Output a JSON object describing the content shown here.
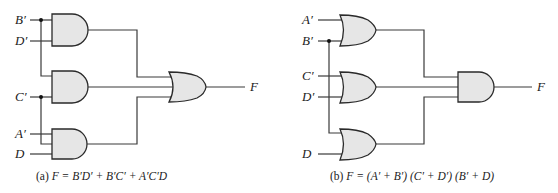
{
  "diagram_a": {
    "inputs": [
      {
        "id": "a_in_b",
        "label": "B′"
      },
      {
        "id": "a_in_d_bar",
        "label": "D′"
      },
      {
        "id": "a_in_c",
        "label": "C′"
      },
      {
        "id": "a_in_a",
        "label": "A′"
      },
      {
        "id": "a_in_d",
        "label": "D"
      }
    ],
    "gates": [
      {
        "id": "and1",
        "type": "AND",
        "inputs": [
          "B′",
          "D′"
        ]
      },
      {
        "id": "and2",
        "type": "AND",
        "inputs": [
          "B′",
          "C′"
        ]
      },
      {
        "id": "and3",
        "type": "AND",
        "inputs": [
          "A′",
          "C′",
          "D"
        ]
      },
      {
        "id": "or_out",
        "type": "OR",
        "inputs": [
          "and1",
          "and2",
          "and3"
        ]
      }
    ],
    "output_label": "F",
    "caption_prefix": "(a) ",
    "caption_var": "F",
    "caption_expr": " = B′D′ + B′C′ + A′C′D"
  },
  "diagram_b": {
    "inputs": [
      {
        "id": "b_in_a",
        "label": "A′"
      },
      {
        "id": "b_in_b",
        "label": "B′"
      },
      {
        "id": "b_in_c",
        "label": "C′"
      },
      {
        "id": "b_in_d_bar",
        "label": "D′"
      },
      {
        "id": "b_in_d",
        "label": "D"
      }
    ],
    "gates": [
      {
        "id": "or1",
        "type": "OR",
        "inputs": [
          "A′",
          "B′"
        ]
      },
      {
        "id": "or2",
        "type": "OR",
        "inputs": [
          "C′",
          "D′"
        ]
      },
      {
        "id": "or3",
        "type": "OR",
        "inputs": [
          "B′",
          "D"
        ]
      },
      {
        "id": "and_out",
        "type": "AND",
        "inputs": [
          "or1",
          "or2",
          "or3"
        ]
      }
    ],
    "output_label": "F",
    "caption_prefix": "(b) ",
    "caption_var": "F",
    "caption_expr": " = (A′ + B′) (C′ + D′) (B′ + D)"
  },
  "colors": {
    "gate_fill": "#e6e6e6",
    "gate_stroke": "#2a2a2a",
    "wire": "#3a3a3a",
    "text": "#222222"
  }
}
